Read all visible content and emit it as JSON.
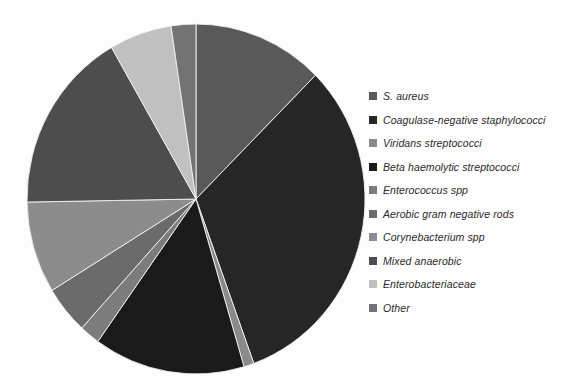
{
  "chart_data": {
    "type": "pie",
    "title": "",
    "subtitle": "",
    "xlabel": "",
    "ylabel": "",
    "legend_position": "right",
    "grid": false,
    "start_angle_deg": 0,
    "direction": "clockwise",
    "center": {
      "x": 172,
      "y": 177
    },
    "radius": {
      "rx": 169,
      "ry": 175
    },
    "categories": [
      "S. aureus",
      "Coagulase-negative staphylococci",
      "Viridans streptococci",
      "Beta haemolytic streptococci",
      "Enterococcus spp",
      "Aerobic gram negative rods",
      "Corynebacterium spp",
      "Mixed anaerobic",
      "Enterobacteriaceae",
      "Other"
    ],
    "values": [
      12.5,
      32.0,
      1.0,
      14.5,
      2.0,
      4.5,
      8.5,
      17.0,
      6.0,
      2.0
    ],
    "unit": "%",
    "slices": [
      {
        "label": "S. aureus",
        "value": 12.5,
        "start_deg": 0.0,
        "end_deg": 45.0,
        "color": "#595959"
      },
      {
        "label": "Coagulase-negative staphylococci",
        "value": 32.0,
        "start_deg": 45.0,
        "end_deg": 160.0,
        "color": "#262626"
      },
      {
        "label": "Viridans streptococci",
        "value": 1.0,
        "start_deg": 160.0,
        "end_deg": 163.5,
        "color": "#8a8a8a"
      },
      {
        "label": "Beta haemolytic streptococci",
        "value": 14.5,
        "start_deg": 163.5,
        "end_deg": 215.5,
        "color": "#1a1a1a"
      },
      {
        "label": "Enterococcus spp",
        "value": 2.0,
        "start_deg": 215.5,
        "end_deg": 222.5,
        "color": "#7c7c7c"
      },
      {
        "label": "Aerobic gram negative rods",
        "value": 4.5,
        "start_deg": 222.5,
        "end_deg": 238.5,
        "color": "#6b6b6b"
      },
      {
        "label": "Corynebacterium spp",
        "value": 8.5,
        "start_deg": 238.5,
        "end_deg": 269.0,
        "color": "#8c8c8c"
      },
      {
        "label": "Mixed anaerobic",
        "value": 17.0,
        "start_deg": 269.0,
        "end_deg": 330.0,
        "color": "#4d4d4d"
      },
      {
        "label": "Enterobacteriaceae",
        "value": 6.0,
        "start_deg": 330.0,
        "end_deg": 351.5,
        "color": "#c0c0c0"
      },
      {
        "label": "Other",
        "value": 2.0,
        "start_deg": 351.5,
        "end_deg": 360.0,
        "color": "#737373"
      }
    ]
  },
  "legend": {
    "items": [
      {
        "label": "S. aureus",
        "color": "#595959"
      },
      {
        "label": "Coagulase-negative staphylococci",
        "color": "#262626"
      },
      {
        "label": "Viridans streptococci",
        "color": "#8a8a8a"
      },
      {
        "label": "Beta haemolytic streptococci",
        "color": "#1a1a1a"
      },
      {
        "label": "Enterococcus spp",
        "color": "#7c7c7c"
      },
      {
        "label": "Aerobic gram negative rods",
        "color": "#6b6b6b"
      },
      {
        "label": "Corynebacterium spp",
        "color": "#8c8c8c"
      },
      {
        "label": "Mixed anaerobic",
        "color": "#4d4d4d"
      },
      {
        "label": "Enterobacteriaceae",
        "color": "#c0c0c0"
      },
      {
        "label": "Other",
        "color": "#737373"
      }
    ]
  }
}
